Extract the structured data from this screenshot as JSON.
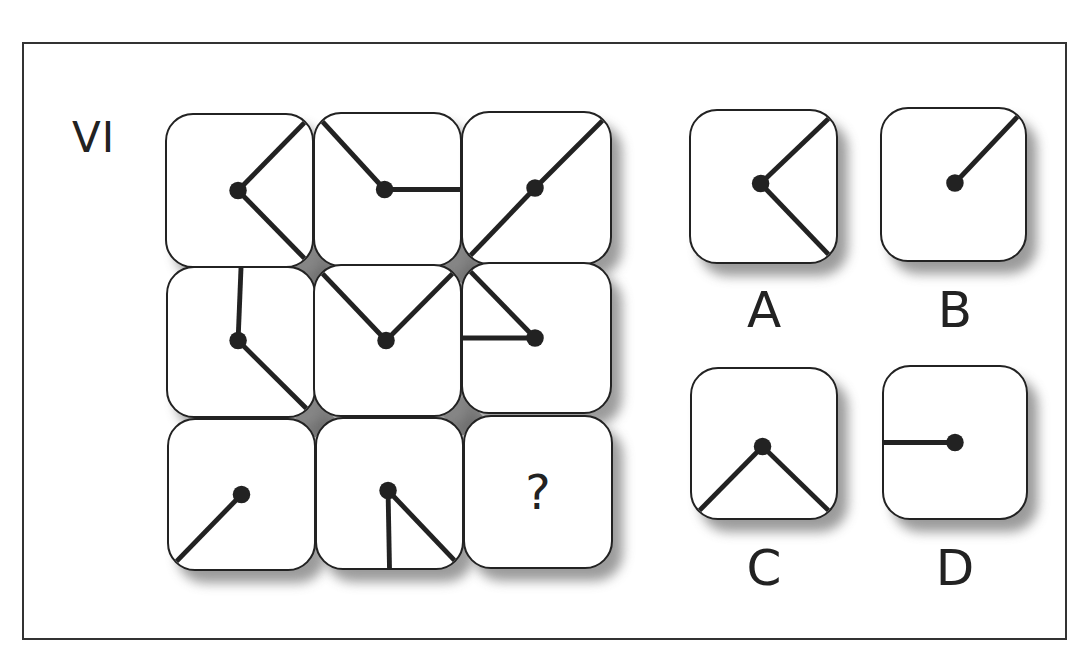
{
  "puzzle": {
    "label": "VI",
    "question_mark": "?",
    "colors": {
      "line": "#222222",
      "dot": "#222222",
      "gap_fill": "#6e6e6e",
      "shadow": "#8a8a8a",
      "frame": "#333333"
    },
    "grid": [
      {
        "id": "r1c1",
        "x": 165,
        "y": 113,
        "w": 149,
        "h": 155,
        "dot": [
          0.49,
          0.5
        ],
        "segments": [
          [
            "dot",
            "tr"
          ],
          [
            "dot",
            "br"
          ]
        ]
      },
      {
        "id": "r1c2",
        "x": 313,
        "y": 112,
        "w": 149,
        "h": 155,
        "dot": [
          0.48,
          0.5
        ],
        "segments": [
          [
            "dot",
            "tl"
          ],
          [
            "dot",
            "mr"
          ]
        ]
      },
      {
        "id": "r1c3",
        "x": 461,
        "y": 111,
        "w": 151,
        "h": 154,
        "dot": [
          0.49,
          0.5
        ],
        "segments": [
          [
            "dot",
            "tr"
          ],
          [
            "dot",
            "bl"
          ]
        ]
      },
      {
        "id": "r2c1",
        "x": 166,
        "y": 266,
        "w": 150,
        "h": 152,
        "dot": [
          0.48,
          0.49
        ],
        "segments": [
          [
            "dot",
            "tm"
          ],
          [
            "dot",
            "br"
          ]
        ]
      },
      {
        "id": "r2c2",
        "x": 313,
        "y": 264,
        "w": 149,
        "h": 153,
        "dot": [
          0.49,
          0.5
        ],
        "segments": [
          [
            "dot",
            "tl"
          ],
          [
            "dot",
            "tr"
          ]
        ]
      },
      {
        "id": "r2c3",
        "x": 461,
        "y": 262,
        "w": 151,
        "h": 152,
        "dot": [
          0.49,
          0.5
        ],
        "segments": [
          [
            "dot",
            "tl"
          ],
          [
            "dot",
            "ml"
          ]
        ]
      },
      {
        "id": "r3c1",
        "x": 167,
        "y": 418,
        "w": 149,
        "h": 153,
        "dot": [
          0.5,
          0.5
        ],
        "segments": [
          [
            "dot",
            "bl"
          ]
        ]
      },
      {
        "id": "r3c2",
        "x": 315,
        "y": 417,
        "w": 149,
        "h": 153,
        "dot": [
          0.49,
          0.48
        ],
        "segments": [
          [
            "dot",
            "bm"
          ],
          [
            "dot",
            "br"
          ]
        ]
      },
      {
        "id": "r3c3",
        "x": 463,
        "y": 415,
        "w": 150,
        "h": 154,
        "dot": null,
        "segments": [],
        "question": true
      }
    ],
    "gap_diamonds": [
      [
        314,
        267
      ],
      [
        462,
        264
      ],
      [
        315,
        418
      ],
      [
        463,
        416
      ]
    ],
    "options": [
      {
        "label": "A",
        "x": 689,
        "y": 109,
        "w": 149,
        "h": 155,
        "dot": [
          0.48,
          0.48
        ],
        "segments": [
          [
            "dot",
            "tr"
          ],
          [
            "dot",
            "br"
          ]
        ],
        "label_x": 724,
        "label_y": 285
      },
      {
        "label": "B",
        "x": 880,
        "y": 107,
        "w": 147,
        "h": 155,
        "dot": [
          0.51,
          0.49
        ],
        "segments": [
          [
            "dot",
            "tr"
          ]
        ],
        "label_x": 915,
        "label_y": 285
      },
      {
        "label": "C",
        "x": 690,
        "y": 367,
        "w": 148,
        "h": 153,
        "dot": [
          0.49,
          0.52
        ],
        "segments": [
          [
            "dot",
            "bl"
          ],
          [
            "dot",
            "br"
          ]
        ],
        "label_x": 724,
        "label_y": 543
      },
      {
        "label": "D",
        "x": 882,
        "y": 365,
        "w": 146,
        "h": 155,
        "dot": [
          0.5,
          0.5
        ],
        "segments": [
          [
            "dot",
            "ml"
          ]
        ],
        "label_x": 915,
        "label_y": 543
      }
    ]
  }
}
